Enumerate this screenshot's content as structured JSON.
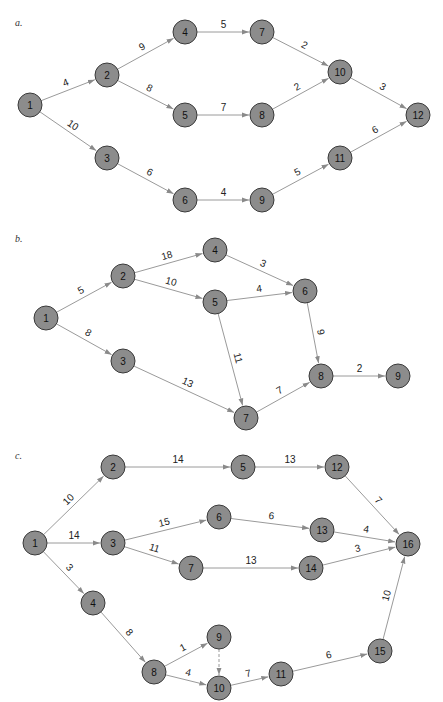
{
  "node_style": {
    "fill": "#8c8c8c",
    "stroke": "#3a3a3a",
    "radius": 12
  },
  "edge_color": "#9a9a9a",
  "diagrams": [
    {
      "label": "a.",
      "label_pos": [
        15,
        26
      ],
      "nodes": [
        {
          "id": "1",
          "x": 30,
          "y": 105
        },
        {
          "id": "2",
          "x": 107,
          "y": 75
        },
        {
          "id": "3",
          "x": 107,
          "y": 158
        },
        {
          "id": "4",
          "x": 185,
          "y": 32
        },
        {
          "id": "5",
          "x": 185,
          "y": 115
        },
        {
          "id": "6",
          "x": 185,
          "y": 200
        },
        {
          "id": "7",
          "x": 262,
          "y": 32
        },
        {
          "id": "8",
          "x": 262,
          "y": 115
        },
        {
          "id": "9",
          "x": 262,
          "y": 200
        },
        {
          "id": "10",
          "x": 340,
          "y": 72
        },
        {
          "id": "11",
          "x": 340,
          "y": 158
        },
        {
          "id": "12",
          "x": 418,
          "y": 115
        }
      ],
      "edges": [
        {
          "from": "1",
          "to": "2",
          "weight": "4"
        },
        {
          "from": "1",
          "to": "3",
          "weight": "10"
        },
        {
          "from": "2",
          "to": "4",
          "weight": "9"
        },
        {
          "from": "2",
          "to": "5",
          "weight": "8"
        },
        {
          "from": "3",
          "to": "6",
          "weight": "6"
        },
        {
          "from": "4",
          "to": "7",
          "weight": "5"
        },
        {
          "from": "5",
          "to": "8",
          "weight": "7"
        },
        {
          "from": "6",
          "to": "9",
          "weight": "4"
        },
        {
          "from": "7",
          "to": "10",
          "weight": "2"
        },
        {
          "from": "8",
          "to": "10",
          "weight": "2"
        },
        {
          "from": "9",
          "to": "11",
          "weight": "5"
        },
        {
          "from": "10",
          "to": "12",
          "weight": "3"
        },
        {
          "from": "11",
          "to": "12",
          "weight": "6"
        }
      ]
    },
    {
      "label": "b.",
      "label_pos": [
        15,
        242
      ],
      "nodes": [
        {
          "id": "1",
          "x": 46,
          "y": 318
        },
        {
          "id": "2",
          "x": 123,
          "y": 276
        },
        {
          "id": "3",
          "x": 123,
          "y": 361
        },
        {
          "id": "4",
          "x": 215,
          "y": 250
        },
        {
          "id": "5",
          "x": 215,
          "y": 302
        },
        {
          "id": "6",
          "x": 305,
          "y": 291
        },
        {
          "id": "7",
          "x": 246,
          "y": 418
        },
        {
          "id": "8",
          "x": 321,
          "y": 376
        },
        {
          "id": "9",
          "x": 398,
          "y": 376
        }
      ],
      "edges": [
        {
          "from": "1",
          "to": "2",
          "weight": "5"
        },
        {
          "from": "1",
          "to": "3",
          "weight": "8"
        },
        {
          "from": "2",
          "to": "4",
          "weight": "18"
        },
        {
          "from": "2",
          "to": "5",
          "weight": "10"
        },
        {
          "from": "3",
          "to": "7",
          "weight": "13"
        },
        {
          "from": "4",
          "to": "6",
          "weight": "3"
        },
        {
          "from": "5",
          "to": "6",
          "weight": "4"
        },
        {
          "from": "5",
          "to": "7",
          "weight": "11"
        },
        {
          "from": "6",
          "to": "8",
          "weight": "9"
        },
        {
          "from": "7",
          "to": "8",
          "weight": "7"
        },
        {
          "from": "8",
          "to": "9",
          "weight": "2"
        }
      ]
    },
    {
      "label": "c.",
      "label_pos": [
        15,
        459
      ],
      "nodes": [
        {
          "id": "1",
          "x": 35,
          "y": 543
        },
        {
          "id": "2",
          "x": 113,
          "y": 467
        },
        {
          "id": "3",
          "x": 113,
          "y": 543
        },
        {
          "id": "4",
          "x": 93,
          "y": 603
        },
        {
          "id": "5",
          "x": 243,
          "y": 467
        },
        {
          "id": "6",
          "x": 219,
          "y": 517
        },
        {
          "id": "7",
          "x": 191,
          "y": 568
        },
        {
          "id": "8",
          "x": 154,
          "y": 672
        },
        {
          "id": "9",
          "x": 219,
          "y": 637
        },
        {
          "id": "10",
          "x": 219,
          "y": 688
        },
        {
          "id": "11",
          "x": 281,
          "y": 674
        },
        {
          "id": "12",
          "x": 337,
          "y": 467
        },
        {
          "id": "13",
          "x": 322,
          "y": 530
        },
        {
          "id": "14",
          "x": 311,
          "y": 568
        },
        {
          "id": "15",
          "x": 380,
          "y": 651
        },
        {
          "id": "16",
          "x": 408,
          "y": 544
        }
      ],
      "edges": [
        {
          "from": "1",
          "to": "2",
          "weight": "10"
        },
        {
          "from": "1",
          "to": "3",
          "weight": "14"
        },
        {
          "from": "1",
          "to": "4",
          "weight": "3"
        },
        {
          "from": "2",
          "to": "5",
          "weight": "14"
        },
        {
          "from": "3",
          "to": "6",
          "weight": "15"
        },
        {
          "from": "3",
          "to": "7",
          "weight": "11"
        },
        {
          "from": "4",
          "to": "8",
          "weight": "8"
        },
        {
          "from": "5",
          "to": "12",
          "weight": "13"
        },
        {
          "from": "6",
          "to": "13",
          "weight": "6"
        },
        {
          "from": "7",
          "to": "14",
          "weight": "13"
        },
        {
          "from": "8",
          "to": "9",
          "weight": "1"
        },
        {
          "from": "8",
          "to": "10",
          "weight": "4"
        },
        {
          "from": "9",
          "to": "10",
          "weight": "",
          "dashed": true
        },
        {
          "from": "10",
          "to": "11",
          "weight": "7"
        },
        {
          "from": "11",
          "to": "15",
          "weight": "6"
        },
        {
          "from": "12",
          "to": "16",
          "weight": "7"
        },
        {
          "from": "13",
          "to": "16",
          "weight": "4"
        },
        {
          "from": "14",
          "to": "16",
          "weight": "3"
        },
        {
          "from": "15",
          "to": "16",
          "weight": "10"
        }
      ]
    }
  ]
}
